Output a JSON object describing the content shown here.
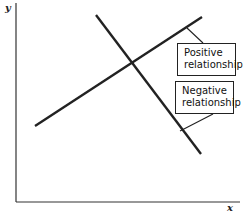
{
  "axes": {
    "y_label": "y",
    "x_label": "x"
  },
  "labels": {
    "positive": {
      "line1": "Positive",
      "line2": "relationship"
    },
    "negative": {
      "line1": "Negative",
      "line2": "relationship"
    }
  },
  "lines": {
    "positive": {
      "x1": 35,
      "y1": 126,
      "x2": 202,
      "y2": 17
    },
    "negative": {
      "x1": 96,
      "y1": 15,
      "x2": 201,
      "y2": 154
    }
  },
  "colors": {
    "line": "#222222",
    "background": "#ffffff"
  }
}
